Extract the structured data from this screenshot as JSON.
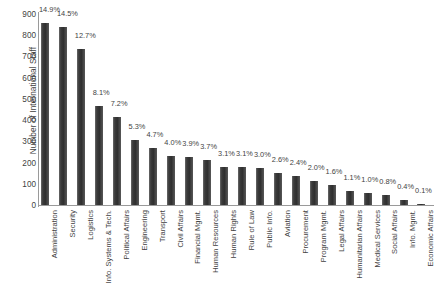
{
  "chart_data": {
    "type": "bar",
    "title": "",
    "xlabel": "",
    "ylabel": "Number of International Staff",
    "ylim": [
      0,
      900
    ],
    "ytick_step": 100,
    "yticks": [
      0,
      100,
      200,
      300,
      400,
      500,
      600,
      700,
      800,
      900
    ],
    "grid": false,
    "legend": "none",
    "bar_color": "#3c3c3c",
    "axis_color": "#9a9a9a",
    "text_color": "#3f3f3f",
    "categories": [
      "Administration",
      "Security",
      "Logistics",
      "Info. Systems & Tech.",
      "Political Affairs",
      "Engineering",
      "Transport",
      "Civil Affairs",
      "Financial Mgmt.",
      "Human Resources",
      "Human Rights",
      "Rule of Law",
      "Public Info.",
      "Aviation",
      "Procurement",
      "Program Mgmt.",
      "Legal Affairs",
      "Humanitarian Affairs",
      "Medical Services",
      "Social Affairs",
      "Info. Mgmt.",
      "Economic Affairs"
    ],
    "values": [
      860,
      837,
      733,
      468,
      416,
      306,
      271,
      231,
      225,
      214,
      179,
      179,
      173,
      150,
      139,
      115,
      92,
      64,
      58,
      46,
      23,
      6
    ],
    "data_labels": [
      "14.9%",
      "14.5%",
      "12.7%",
      "8.1%",
      "7.2%",
      "5.3%",
      "4.7%",
      "4.0%",
      "3.9%",
      "3.7%",
      "3.1%",
      "3.1%",
      "3.0%",
      "2.6%",
      "2.4%",
      "2.0%",
      "1.6%",
      "1.1%",
      "1.0%",
      "0.8%",
      "0.4%",
      "0.1%"
    ],
    "percentages": [
      14.9,
      14.5,
      12.7,
      8.1,
      7.2,
      5.3,
      4.7,
      4.0,
      3.9,
      3.7,
      3.1,
      3.1,
      3.0,
      2.6,
      2.4,
      2.0,
      1.6,
      1.1,
      1.0,
      0.8,
      0.4,
      0.1
    ]
  }
}
